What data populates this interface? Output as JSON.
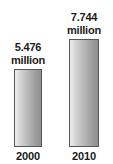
{
  "chart_data": {
    "type": "bar",
    "title": "",
    "xlabel": "",
    "ylabel": "",
    "categories": [
      "2000",
      "2010"
    ],
    "values": [
      5.476,
      7.744
    ],
    "value_labels": [
      "5.476",
      "7.744"
    ],
    "unit": "million",
    "grid": false,
    "legend": false,
    "ylim": [
      0,
      7.744
    ],
    "bars": [
      {
        "category": "2000",
        "value": 5.476,
        "value_text": "5.476",
        "unit_text": "million",
        "year_text": "2000"
      },
      {
        "category": "2010",
        "value": 7.744,
        "value_text": "7.744",
        "unit_text": "million",
        "year_text": "2010"
      }
    ],
    "colors": {
      "background": "#ffffff",
      "bar_gradient_start": "#ededed",
      "bar_gradient_end": "#8f8f8f",
      "bar_border": "#575757",
      "text": "#1b1b1b"
    }
  }
}
